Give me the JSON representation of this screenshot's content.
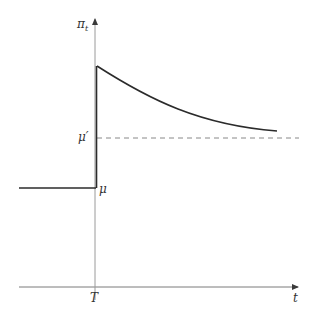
{
  "diagram": {
    "type": "step-then-decay",
    "colors": {
      "axis": "#7a7a7a",
      "curve": "#2b2b2b",
      "dashed": "#888888",
      "label": "#333333"
    },
    "axes": {
      "y_label": "π",
      "y_label_sub": "t",
      "x_label": "t",
      "x_tick_label": "T"
    },
    "levels": {
      "mu": "μ",
      "mu_prime": "μ′"
    }
  }
}
